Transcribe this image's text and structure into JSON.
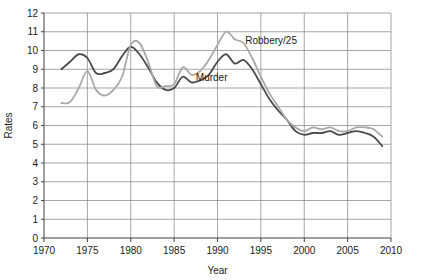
{
  "chart_data": {
    "type": "line",
    "title": "",
    "xlabel": "Year",
    "ylabel": "Rates",
    "xlim": [
      1970,
      2010
    ],
    "ylim": [
      0,
      12
    ],
    "xticks": [
      1970,
      1975,
      1980,
      1985,
      1990,
      1995,
      2000,
      2005,
      2010
    ],
    "yticks": [
      0,
      1,
      2,
      3,
      4,
      5,
      6,
      7,
      8,
      9,
      10,
      11,
      12
    ],
    "grid": "horizontal-and-vertical",
    "legend_position": "inline-annotations",
    "colors": {
      "murder": "#4a4a4a",
      "robbery": "#a8a8a8",
      "grid": "#808080",
      "axis": "#404040"
    },
    "x": [
      1972,
      1973,
      1974,
      1975,
      1976,
      1977,
      1978,
      1979,
      1980,
      1981,
      1982,
      1983,
      1984,
      1985,
      1986,
      1987,
      1988,
      1989,
      1990,
      1991,
      1992,
      1993,
      1994,
      1995,
      1996,
      1997,
      1998,
      1999,
      2000,
      2001,
      2002,
      2003,
      2004,
      2005,
      2006,
      2007,
      2008,
      2009
    ],
    "series": [
      {
        "name": "Murder",
        "label": "Murder",
        "color": "#4a4a4a",
        "annotation_x": 1987.5,
        "annotation_y": 8.35,
        "values": [
          9.0,
          9.4,
          9.8,
          9.6,
          8.8,
          8.8,
          9.0,
          9.7,
          10.2,
          9.8,
          9.1,
          8.3,
          7.9,
          8.0,
          8.6,
          8.3,
          8.4,
          8.7,
          9.4,
          9.8,
          9.3,
          9.5,
          9.0,
          8.2,
          7.4,
          6.8,
          6.3,
          5.7,
          5.5,
          5.6,
          5.6,
          5.7,
          5.5,
          5.6,
          5.7,
          5.6,
          5.4,
          4.9
        ]
      },
      {
        "name": "Robbery/25",
        "label": "Robbery/25",
        "color": "#a8a8a8",
        "annotation_x": 1993.2,
        "annotation_y": 10.35,
        "values": [
          7.2,
          7.25,
          8.0,
          8.9,
          7.9,
          7.6,
          7.9,
          8.6,
          10.3,
          10.4,
          9.4,
          8.1,
          8.1,
          8.2,
          9.1,
          8.7,
          8.9,
          9.5,
          10.3,
          11.0,
          10.6,
          10.4,
          9.6,
          8.6,
          7.7,
          7.0,
          6.3,
          5.9,
          5.7,
          5.9,
          5.8,
          5.9,
          5.7,
          5.7,
          5.9,
          5.9,
          5.8,
          5.4
        ]
      }
    ],
    "annotations": [
      {
        "text": "Robbery/25",
        "x": 1993.2,
        "y": 10.35
      },
      {
        "text": "Murder",
        "x": 1987.5,
        "y": 8.35
      }
    ]
  }
}
